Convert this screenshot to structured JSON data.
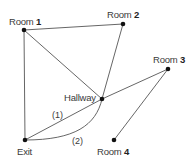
{
  "diagram": {
    "nodes": [
      {
        "id": "room1",
        "prefix": "Room",
        "number": "1",
        "x": 24,
        "y": 30
      },
      {
        "id": "room2",
        "prefix": "Room",
        "number": "2",
        "x": 123,
        "y": 24
      },
      {
        "id": "room3",
        "prefix": "Room",
        "number": "3",
        "x": 168,
        "y": 69
      },
      {
        "id": "hallway",
        "label": "Hallway",
        "x": 102,
        "y": 99
      },
      {
        "id": "exit",
        "label": "Exit",
        "x": 25,
        "y": 140
      },
      {
        "id": "room4",
        "prefix": "Room",
        "number": "4",
        "x": 114,
        "y": 140
      }
    ],
    "edges": [
      {
        "from": "room1",
        "to": "room2",
        "type": "straight"
      },
      {
        "from": "room1",
        "to": "exit",
        "type": "straight"
      },
      {
        "from": "room1",
        "to": "hallway",
        "type": "straight"
      },
      {
        "from": "room2",
        "to": "hallway",
        "type": "straight"
      },
      {
        "from": "room3",
        "to": "hallway",
        "type": "straight"
      },
      {
        "from": "room3",
        "to": "room4",
        "type": "straight"
      },
      {
        "from": "hallway",
        "to": "exit",
        "type": "straight",
        "label": "(1)"
      },
      {
        "from": "hallway",
        "to": "exit",
        "type": "curved",
        "label": "(2)"
      }
    ],
    "edge_labels": {
      "path1": "(1)",
      "path2": "(2)"
    },
    "colors": {
      "line": "#555555",
      "node": "#111111",
      "text": "#3a3a3a"
    }
  }
}
